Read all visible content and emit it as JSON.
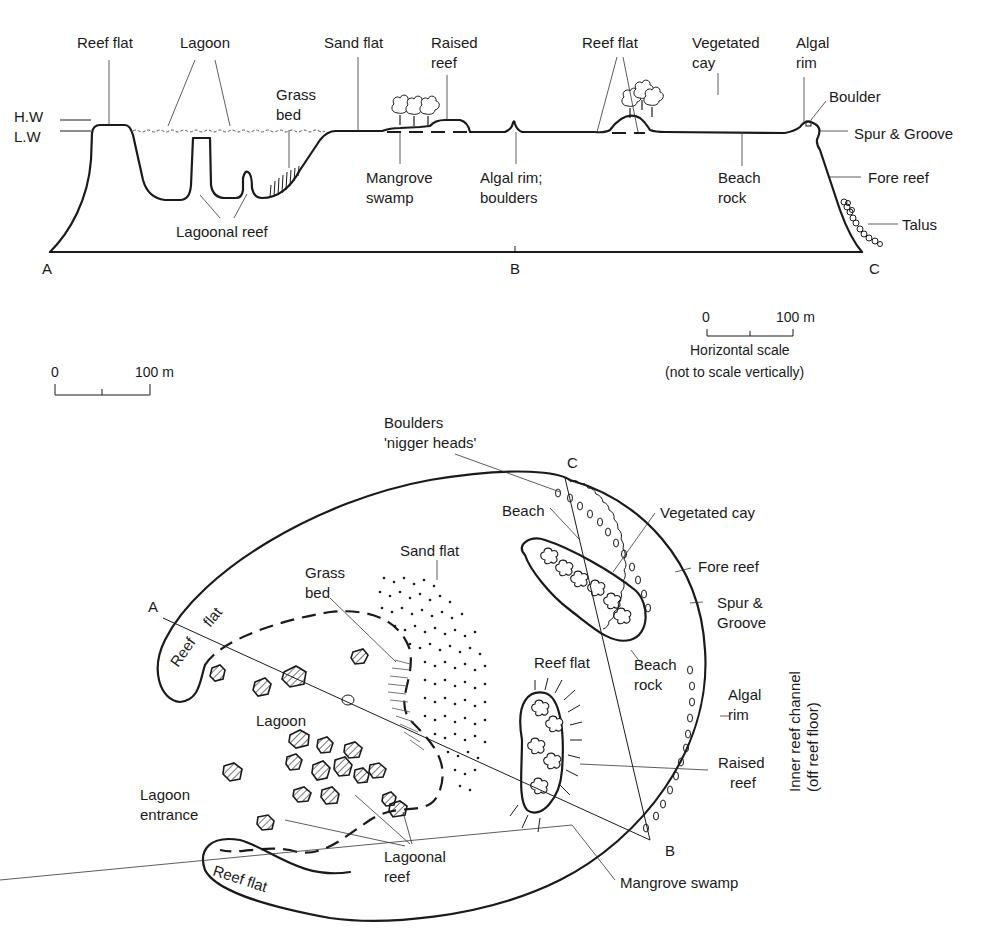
{
  "header_partial": "",
  "cross_section": {
    "water_levels": {
      "high": "H.W",
      "low": "L.W"
    },
    "labels": {
      "reef_flat_left": "Reef flat",
      "lagoon": "Lagoon",
      "grass_bed_1": "Grass",
      "grass_bed_2": "bed",
      "lagoonal_reef": "Lagoonal reef",
      "sand_flat": "Sand flat",
      "raised_reef_1": "Raised",
      "raised_reef_2": "reef",
      "mangrove_1": "Mangrove",
      "mangrove_2": "swamp",
      "algal_rim_boulders_1": "Algal rim;",
      "algal_rim_boulders_2": "boulders",
      "reef_flat_right": "Reef flat",
      "vegetated_cay_1": "Vegetated",
      "vegetated_cay_2": "cay",
      "beach_rock_1": "Beach",
      "beach_rock_2": "rock",
      "algal_rim_1": "Algal",
      "algal_rim_2": "rim",
      "boulder": "Boulder",
      "spur_groove": "Spur & Groove",
      "fore_reef": "Fore reef",
      "talus": "Talus"
    },
    "points": {
      "a": "A",
      "b": "B",
      "c": "C"
    },
    "scale": {
      "zero": "0",
      "max": "100 m",
      "caption_1": "Horizontal scale",
      "caption_2": "(not to scale vertically)"
    }
  },
  "plan_view": {
    "scale": {
      "zero": "0",
      "max": "100 m"
    },
    "labels": {
      "boulders_1": "Boulders",
      "boulders_2": "'nigger heads'",
      "beach": "Beach",
      "vegetated_cay": "Vegetated cay",
      "sand_flat": "Sand flat",
      "grass_bed_1": "Grass",
      "grass_bed_2": "bed",
      "fore_reef": "Fore reef",
      "spur_groove_1": "Spur &",
      "spur_groove_2": "Groove",
      "reef_flat_center": "Reef flat",
      "beach_rock_1": "Beach",
      "beach_rock_2": "rock",
      "algal_rim_1": "Algal",
      "algal_rim_2": "rim",
      "raised_reef_1": "Raised",
      "raised_reef_2": "reef",
      "inner_channel_1": "Inner reef channel",
      "inner_channel_2": "(off reef floor)",
      "reef_flat_top_a": "Reef",
      "reef_flat_top_b": "flat",
      "lagoon": "Lagoon",
      "lagoon_entrance_1": "Lagoon",
      "lagoon_entrance_2": "entrance",
      "lagoonal_reef_1": "Lagoonal",
      "lagoonal_reef_2": "reef",
      "reef_flat_bottom": "Reef flat",
      "mangrove_swamp": "Mangrove swamp"
    },
    "points": {
      "a": "A",
      "b": "B",
      "c": "C"
    }
  },
  "caption_partial": ""
}
